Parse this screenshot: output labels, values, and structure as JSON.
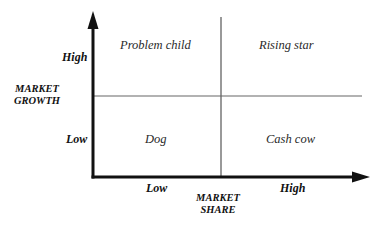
{
  "diagram": {
    "y_axis": {
      "title_line1": "MARKET",
      "title_line2": "GROWTH",
      "high_label": "High",
      "low_label": "Low"
    },
    "x_axis": {
      "title_line1": "MARKET",
      "title_line2": "SHARE",
      "low_label": "Low",
      "high_label": "High"
    },
    "quadrants": {
      "top_left": "Problem child",
      "top_right": "Rising star",
      "bottom_left": "Dog",
      "bottom_right": "Cash cow"
    },
    "colors": {
      "axis": "#111111",
      "divider": "#555555",
      "text": "#1a1a1a"
    }
  }
}
